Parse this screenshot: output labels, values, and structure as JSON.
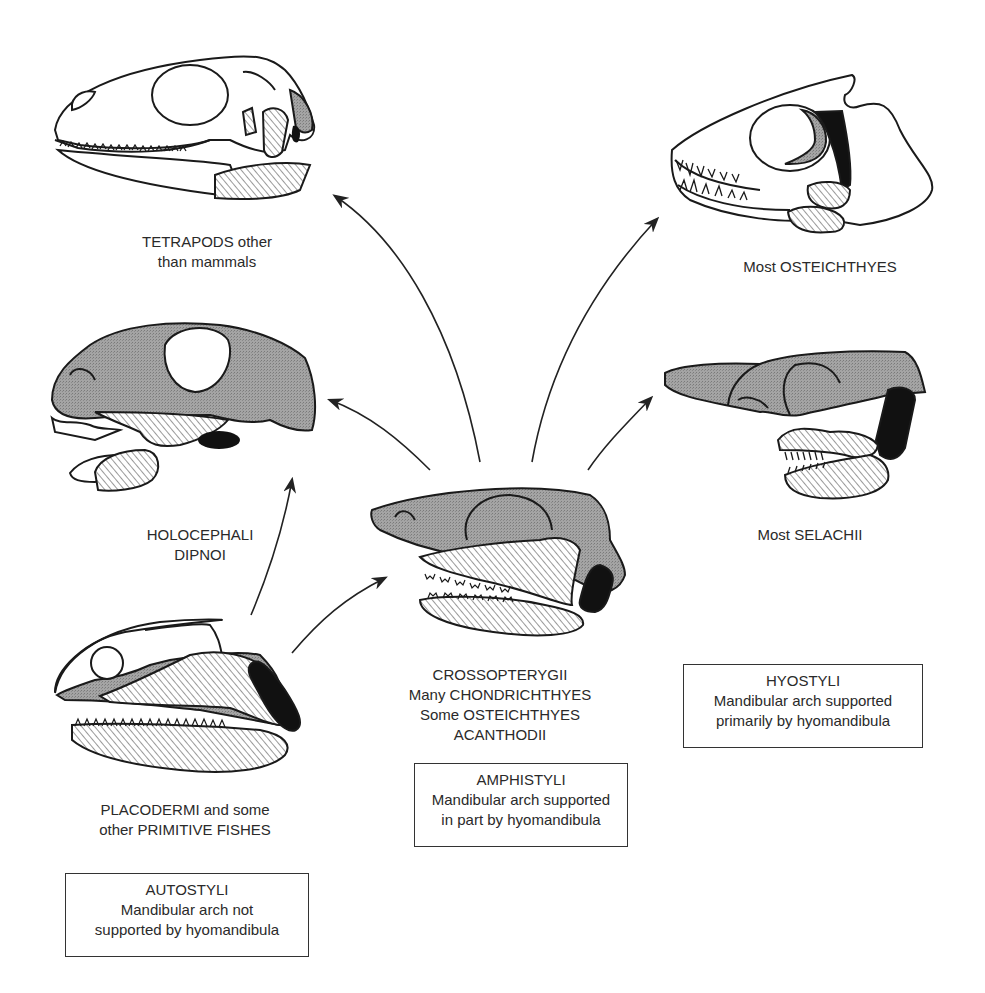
{
  "diagram": {
    "type": "evolutionary jaw suspension diagram",
    "colors": {
      "outline": "#1a1a1a",
      "stipple_gray": "#9a9a9a",
      "hatch": "#444444",
      "black_hyomandibula": "#111111",
      "background": "#ffffff"
    },
    "groups": [
      {
        "id": "tetrapods",
        "label_lines": [
          "TETRAPODS other",
          "than mammals"
        ]
      },
      {
        "id": "osteichthyes",
        "label_lines": [
          "Most OSTEICHTHYES"
        ]
      },
      {
        "id": "holocephali",
        "label_lines": [
          "HOLOCEPHALI",
          "DIPNOI"
        ]
      },
      {
        "id": "selachii",
        "label_lines": [
          "Most SELACHII"
        ]
      },
      {
        "id": "crossopterygii",
        "label_lines": [
          "CROSSOPTERYGII",
          "Many CHONDRICHTHYES",
          "Some OSTEICHTHYES",
          "ACANTHODII"
        ]
      },
      {
        "id": "placodermi",
        "label_lines": [
          "PLACODERMI and some",
          "other PRIMITIVE FISHES"
        ]
      }
    ],
    "boxes": [
      {
        "id": "autostyli",
        "title": "AUTOSTYLI",
        "lines": [
          "Mandibular arch not",
          "supported by hyomandibula"
        ]
      },
      {
        "id": "amphistyli",
        "title": "AMPHISTYLI",
        "lines": [
          "Mandibular arch supported",
          "in part by hyomandibula"
        ]
      },
      {
        "id": "hyostyli",
        "title": "HYOSTYLI",
        "lines": [
          "Mandibular arch supported",
          "primarily by hyomandibula"
        ]
      }
    ],
    "arrows": [
      {
        "from": "placodermi",
        "to": "holocephali"
      },
      {
        "from": "placodermi",
        "to": "crossopterygii"
      },
      {
        "from": "crossopterygii",
        "to": "holocephali"
      },
      {
        "from": "crossopterygii",
        "to": "tetrapods"
      },
      {
        "from": "crossopterygii",
        "to": "osteichthyes"
      },
      {
        "from": "crossopterygii",
        "to": "selachii"
      }
    ]
  }
}
